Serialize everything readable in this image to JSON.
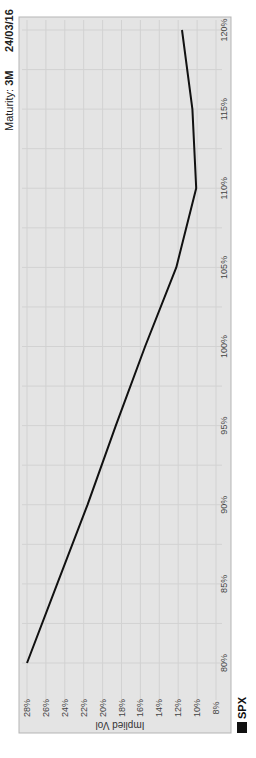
{
  "header": {
    "maturity_label": "Maturity:",
    "maturity_value": "3M",
    "date": "24/03/16"
  },
  "legend": {
    "label": "SPX",
    "color": "#111111"
  },
  "colors": {
    "panel_bg": "#e4e4e4",
    "panel_border": "#b5b5b5",
    "grid": "#d2d2d2",
    "line": "#111111",
    "tick_text": "#444444"
  },
  "chart_data": {
    "type": "line",
    "title": "",
    "orientation": "rotated 90deg clockwise",
    "xlabel": "",
    "ylabel": "Implied Vol",
    "x": [
      80,
      85,
      90,
      95,
      100,
      105,
      110,
      115,
      120
    ],
    "x_tick_labels": [
      "80%",
      "85%",
      "90%",
      "95%",
      "100%",
      "105%",
      "110%",
      "115%",
      "120%"
    ],
    "y_tick_labels": [
      "8%",
      "10%",
      "12%",
      "14%",
      "16%",
      "18%",
      "20%",
      "22%",
      "24%",
      "26%",
      "28%"
    ],
    "xlim": [
      80,
      120
    ],
    "ylim": [
      8,
      28
    ],
    "grid": true,
    "legend_position": "bottom-right",
    "series": [
      {
        "name": "SPX",
        "values": [
          28.0,
          24.8,
          21.6,
          18.6,
          15.5,
          12.2,
          10.1,
          10.5,
          11.6
        ]
      }
    ]
  }
}
